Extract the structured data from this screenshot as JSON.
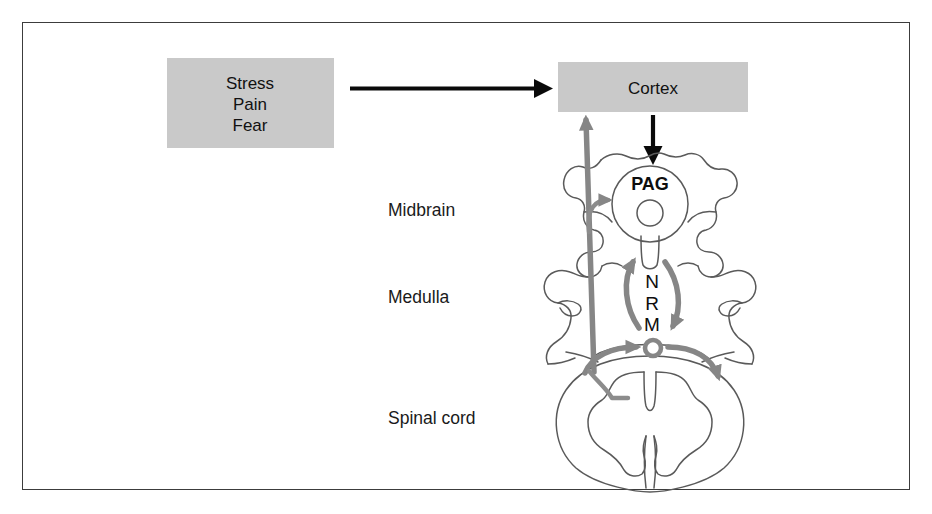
{
  "figure": {
    "type": "anatomical-schematic",
    "title_hidden": "Descending pain modulation pathway",
    "background_color": "#ffffff",
    "border_color": "#3c3c3c"
  },
  "colors": {
    "box_fill": "#c9c9c9",
    "gray_arrow": "#868686",
    "black_arrow": "#0a0a0a",
    "outline": "#5a5a5a",
    "text": "#111111"
  },
  "boxes": [
    {
      "id": "stimulus-box",
      "lines": [
        "Stress",
        "Pain",
        "Fear"
      ]
    },
    {
      "id": "cortex-box",
      "lines": [
        "Cortex"
      ]
    }
  ],
  "stimulus_box": {
    "line1": "Stress",
    "line2": "Pain",
    "line3": "Fear"
  },
  "cortex_box": {
    "label": "Cortex"
  },
  "region_labels": [
    {
      "id": "midbrain-label",
      "text": "Midbrain"
    },
    {
      "id": "medulla-label",
      "text": "Medulla"
    },
    {
      "id": "spinal-cord-label",
      "text": "Spinal cord"
    }
  ],
  "regions": {
    "midbrain": "Midbrain",
    "medulla": "Medulla",
    "spinal_cord": "Spinal cord"
  },
  "structures": {
    "pag": "PAG",
    "nrm_letters": [
      "N",
      "R",
      "M"
    ],
    "nrm_line1": "N",
    "nrm_line2": "R",
    "nrm_line3": "M"
  },
  "arrows": [
    {
      "id": "stimulus-to-cortex",
      "color": "#0a0a0a",
      "direction": "right",
      "from": "Stress/Pain/Fear",
      "to": "Cortex"
    },
    {
      "id": "cortex-to-pag",
      "color": "#0a0a0a",
      "direction": "down",
      "from": "Cortex",
      "to": "PAG"
    },
    {
      "id": "spinal-to-cortex-ascending",
      "color": "#868686",
      "direction": "up",
      "from": "Spinal cord",
      "to": "Cortex"
    },
    {
      "id": "ascending-branch-to-pag",
      "color": "#868686",
      "direction": "right",
      "from": "Ascending tract",
      "to": "PAG"
    },
    {
      "id": "nrm-to-pag",
      "color": "#868686",
      "direction": "up",
      "from": "NRM",
      "to": "PAG"
    },
    {
      "id": "pag-to-nrm",
      "color": "#868686",
      "direction": "down",
      "from": "PAG",
      "to": "NRM"
    },
    {
      "id": "nrm-to-spinal-left",
      "color": "#868686",
      "direction": "left-descending",
      "from": "NRM",
      "to": "Spinal cord dorsal horn"
    },
    {
      "id": "nrm-to-spinal-right",
      "color": "#868686",
      "direction": "right-descending",
      "from": "NRM",
      "to": "Spinal cord"
    }
  ]
}
